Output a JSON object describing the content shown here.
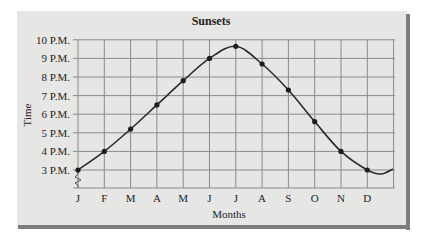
{
  "chart_data": {
    "type": "line",
    "title": "Sunsets",
    "xlabel": "Months",
    "ylabel": "Time",
    "categories": [
      "J",
      "F",
      "M",
      "A",
      "M",
      "J",
      "J",
      "A",
      "S",
      "O",
      "N",
      "D"
    ],
    "series": [
      {
        "name": "Sunset time (hours P.M.)",
        "values": [
          3.0,
          4.0,
          5.2,
          6.5,
          7.8,
          9.0,
          9.65,
          8.7,
          7.3,
          5.6,
          4.0,
          3.0
        ]
      }
    ],
    "yticks": [
      "3 P.M.",
      "4 P.M.",
      "5 P.M.",
      "6 P.M.",
      "7 P.M.",
      "8 P.M.",
      "9 P.M.",
      "10 P.M."
    ],
    "ylim": [
      2,
      10
    ],
    "axis_break": "y-axis below 3 P.M.",
    "grid": true,
    "legend": "none",
    "line_color": "#2b2b2b",
    "background_color": "#e6e6e4"
  }
}
